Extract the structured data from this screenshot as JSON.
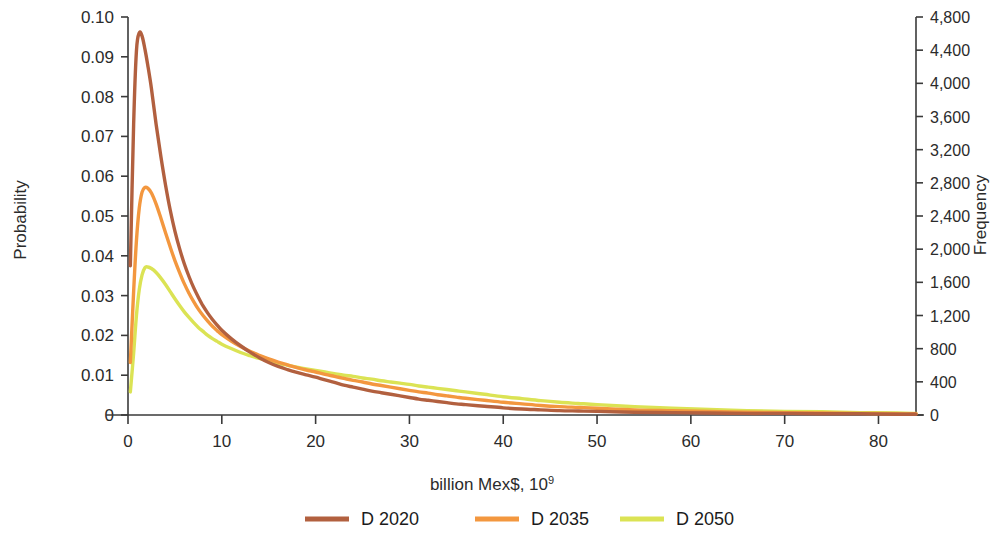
{
  "chart_data": {
    "type": "line",
    "title": "",
    "xlabel": "billion Mex$, 10⁹",
    "ylabel": "Probability",
    "y2label": "Frequency",
    "xlim": [
      0,
      84
    ],
    "ylim": [
      0,
      0.1
    ],
    "y2lim": [
      0,
      4800
    ],
    "grid": false,
    "legend_position": "bottom-center",
    "x_ticks": [
      0,
      10,
      20,
      30,
      40,
      50,
      60,
      70,
      80
    ],
    "x_tick_labels": [
      "0",
      "10",
      "20",
      "30",
      "40",
      "50",
      "60",
      "70",
      "80"
    ],
    "y_ticks": [
      0,
      0.01,
      0.02,
      0.03,
      0.04,
      0.05,
      0.06,
      0.07,
      0.08,
      0.09,
      0.1
    ],
    "y_tick_labels": [
      "0",
      "0.01",
      "0.02",
      "0.03",
      "0.04",
      "0.05",
      "0.06",
      "0.07",
      "0.08",
      "0.09",
      "0.10"
    ],
    "y2_ticks": [
      0,
      400,
      800,
      1200,
      1600,
      2000,
      2400,
      2800,
      3200,
      3600,
      4000,
      4400,
      4800
    ],
    "y2_tick_labels": [
      "0",
      "400",
      "800",
      "1,200",
      "1,600",
      "2,000",
      "2,400",
      "2,800",
      "3,200",
      "3,600",
      "4,000",
      "4,400",
      "4,800"
    ],
    "series": [
      {
        "name": "D 2020",
        "color": "#b2603f",
        "x": [
          0.25,
          0.6,
          0.9,
          1.2,
          1.5,
          1.8,
          2.1,
          2.5,
          3.0,
          3.5,
          4.0,
          4.5,
          5.0,
          5.5,
          6.0,
          6.5,
          7.0,
          7.5,
          8.0,
          8.5,
          9.0,
          9.5,
          10.0,
          11.0,
          12.0,
          13.0,
          14.0,
          15.0,
          16.0,
          17.0,
          18.0,
          19.0,
          20.0,
          21.0,
          22.0,
          23.0,
          24.0,
          25.0,
          26.0,
          27.0,
          28.0,
          29.0,
          30.0,
          31.0,
          32.0,
          33.0,
          34.0,
          35.0,
          36.0,
          38.0,
          40.0,
          42.0,
          44.0,
          46.0,
          48.0,
          50.0,
          54.0,
          58.0,
          62.0,
          66.0,
          70.0,
          74.0,
          78.0,
          82.0,
          84.0
        ],
        "y": [
          0.0375,
          0.073,
          0.0915,
          0.096,
          0.0952,
          0.092,
          0.088,
          0.082,
          0.073,
          0.065,
          0.0578,
          0.0515,
          0.0462,
          0.0418,
          0.038,
          0.0348,
          0.032,
          0.0296,
          0.0274,
          0.0256,
          0.024,
          0.0226,
          0.0213,
          0.0192,
          0.0174,
          0.0158,
          0.0144,
          0.0132,
          0.0122,
          0.0114,
          0.0107,
          0.0101,
          0.0095,
          0.0088,
          0.0082,
          0.0075,
          0.007,
          0.0065,
          0.006,
          0.0056,
          0.0052,
          0.0048,
          0.0044,
          0.004,
          0.0037,
          0.0034,
          0.0031,
          0.0028,
          0.0026,
          0.0022,
          0.0018,
          0.0015,
          0.0013,
          0.0011,
          0.001,
          0.0009,
          0.0007,
          0.0006,
          0.0005,
          0.0004,
          0.0004,
          0.0003,
          0.0003,
          0.0002,
          0.0002
        ]
      },
      {
        "name": "D 2035",
        "color": "#f3973f",
        "x": [
          0.25,
          0.6,
          0.9,
          1.2,
          1.5,
          1.8,
          2.1,
          2.5,
          3.0,
          3.5,
          4.0,
          4.5,
          5.0,
          5.5,
          6.0,
          6.5,
          7.0,
          7.5,
          8.0,
          8.5,
          9.0,
          9.5,
          10.0,
          11.0,
          12.0,
          13.0,
          14.0,
          15.0,
          16.0,
          17.0,
          18.0,
          19.0,
          20.0,
          21.0,
          22.0,
          23.0,
          24.0,
          25.0,
          26.0,
          27.0,
          28.0,
          29.0,
          30.0,
          31.0,
          32.0,
          33.0,
          34.0,
          35.0,
          36.0,
          38.0,
          40.0,
          42.0,
          44.0,
          46.0,
          48.0,
          50.0,
          54.0,
          58.0,
          62.0,
          66.0,
          70.0,
          74.0,
          78.0,
          82.0,
          84.0
        ],
        "y": [
          0.0132,
          0.031,
          0.0438,
          0.052,
          0.056,
          0.0572,
          0.057,
          0.0558,
          0.053,
          0.0495,
          0.0458,
          0.0422,
          0.0388,
          0.0358,
          0.033,
          0.0306,
          0.0285,
          0.0266,
          0.025,
          0.0236,
          0.0223,
          0.0212,
          0.0202,
          0.0186,
          0.0172,
          0.016,
          0.015,
          0.0141,
          0.0133,
          0.0126,
          0.0119,
          0.0113,
          0.0108,
          0.0102,
          0.0097,
          0.0092,
          0.0087,
          0.0083,
          0.0078,
          0.0074,
          0.007,
          0.0066,
          0.0062,
          0.0058,
          0.0055,
          0.0051,
          0.0048,
          0.0045,
          0.0042,
          0.0037,
          0.0032,
          0.0028,
          0.0024,
          0.0021,
          0.0019,
          0.0017,
          0.0013,
          0.0011,
          0.0009,
          0.0007,
          0.0006,
          0.0005,
          0.0004,
          0.0003,
          0.0003
        ]
      },
      {
        "name": "D 2050",
        "color": "#dbe354",
        "x": [
          0.25,
          0.6,
          0.9,
          1.2,
          1.5,
          1.8,
          2.1,
          2.5,
          3.0,
          3.5,
          4.0,
          4.5,
          5.0,
          5.5,
          6.0,
          6.5,
          7.0,
          7.5,
          8.0,
          8.5,
          9.0,
          9.5,
          10.0,
          11.0,
          12.0,
          13.0,
          14.0,
          15.0,
          16.0,
          17.0,
          18.0,
          19.0,
          20.0,
          21.0,
          22.0,
          23.0,
          24.0,
          25.0,
          26.0,
          27.0,
          28.0,
          29.0,
          30.0,
          31.0,
          32.0,
          33.0,
          34.0,
          35.0,
          36.0,
          38.0,
          40.0,
          42.0,
          44.0,
          46.0,
          48.0,
          50.0,
          54.0,
          58.0,
          62.0,
          66.0,
          70.0,
          74.0,
          78.0,
          82.0,
          84.0
        ],
        "y": [
          0.0058,
          0.0155,
          0.025,
          0.0315,
          0.0352,
          0.037,
          0.0372,
          0.0368,
          0.0358,
          0.0344,
          0.0328,
          0.031,
          0.0292,
          0.0275,
          0.0259,
          0.0245,
          0.0232,
          0.022,
          0.021,
          0.02,
          0.0192,
          0.0185,
          0.0178,
          0.0167,
          0.0157,
          0.0149,
          0.0142,
          0.0136,
          0.013,
          0.0125,
          0.012,
          0.0116,
          0.0112,
          0.0108,
          0.0104,
          0.01,
          0.0097,
          0.0093,
          0.009,
          0.0086,
          0.0083,
          0.008,
          0.0077,
          0.0073,
          0.007,
          0.0067,
          0.0064,
          0.0061,
          0.0058,
          0.0052,
          0.0046,
          0.0041,
          0.0036,
          0.0032,
          0.0029,
          0.0026,
          0.0021,
          0.0017,
          0.0014,
          0.0011,
          0.0009,
          0.0008,
          0.0006,
          0.0005,
          0.0004
        ]
      }
    ]
  },
  "legend": {
    "items": [
      {
        "label": "D 2020",
        "color": "#b2603f"
      },
      {
        "label": "D 2035",
        "color": "#f3973f"
      },
      {
        "label": "D 2050",
        "color": "#dbe354"
      }
    ]
  },
  "axes": {
    "left_title": "Probability",
    "right_title": "Frequency",
    "bottom_title_main": "billion Mex$, 10",
    "bottom_title_sup": "9"
  }
}
